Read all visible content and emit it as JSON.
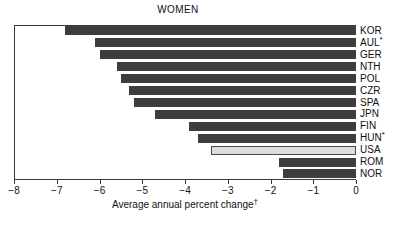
{
  "chart_data": {
    "type": "bar",
    "orientation": "horizontal",
    "title": "WOMEN",
    "xlabel": "Average annual percent change",
    "xlabel_superscript": "†",
    "ylabel": "",
    "xlim": [
      -8,
      0
    ],
    "xticks": [
      -8,
      -7,
      -6,
      -5,
      -4,
      -3,
      -2,
      -1,
      0
    ],
    "xticklabels": [
      "−8",
      "−7",
      "−6",
      "−5",
      "−4",
      "−3",
      "−2",
      "−1",
      "0"
    ],
    "grid": false,
    "legend": false,
    "categories": [
      "KOR",
      "AUL*",
      "GER",
      "NTH",
      "POL",
      "CZR",
      "SPA",
      "JPN",
      "FIN",
      "HUN*",
      "USA",
      "ROM",
      "NOR"
    ],
    "values": [
      -6.8,
      -6.1,
      -6.0,
      -5.6,
      -5.5,
      -5.3,
      -5.2,
      -4.7,
      -3.9,
      -3.7,
      -3.4,
      -1.8,
      -1.7
    ],
    "highlight_category": "USA",
    "colors": {
      "bar": "#3d3d3d",
      "bar_highlight": "#dcdcdc",
      "bar_highlight_edge": "#4a4a4a",
      "axis": "#3a3a3a",
      "text": "#111111",
      "background": "#ffffff"
    },
    "bars": [
      {
        "label": "KOR",
        "value": -6.8,
        "highlighted": false
      },
      {
        "label": "AUL*",
        "value": -6.1,
        "highlighted": false
      },
      {
        "label": "GER",
        "value": -6.0,
        "highlighted": false
      },
      {
        "label": "NTH",
        "value": -5.6,
        "highlighted": false
      },
      {
        "label": "POL",
        "value": -5.5,
        "highlighted": false
      },
      {
        "label": "CZR",
        "value": -5.3,
        "highlighted": false
      },
      {
        "label": "SPA",
        "value": -5.2,
        "highlighted": false
      },
      {
        "label": "JPN",
        "value": -4.7,
        "highlighted": false
      },
      {
        "label": "FIN",
        "value": -3.9,
        "highlighted": false
      },
      {
        "label": "HUN*",
        "value": -3.7,
        "highlighted": false
      },
      {
        "label": "USA",
        "value": -3.4,
        "highlighted": true
      },
      {
        "label": "ROM",
        "value": -1.8,
        "highlighted": false
      },
      {
        "label": "NOR",
        "value": -1.7,
        "highlighted": false
      }
    ]
  }
}
